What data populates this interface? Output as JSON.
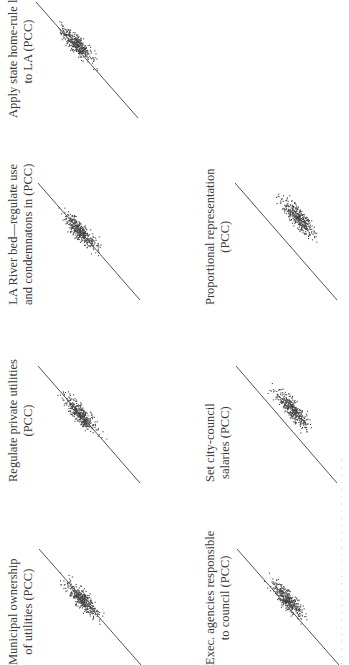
{
  "figure": {
    "orientation": "rotated-90-ccw",
    "caption_visible": "partially clipped at right edge (illegible)"
  },
  "panels": [
    {
      "id": "apply-state-home-rule",
      "label_line1": "Apply state home-rule law",
      "label_line2": "to LA (PCC)"
    },
    {
      "id": "la-river-bed",
      "label_line1": "LA River bed—regulate use",
      "label_line2": "and condemnatons in (PCC)"
    },
    {
      "id": "proportional-representation",
      "label_line1": "Proportional representation",
      "label_line2": "(PCC)"
    },
    {
      "id": "regulate-private-utilities",
      "label_line1": "Regulate private utilities",
      "label_line2": "(PCC)"
    },
    {
      "id": "set-city-council-salaries",
      "label_line1": "Set city-council",
      "label_line2": "salaries (PCC)"
    },
    {
      "id": "municipal-ownership",
      "label_line1": "Municipal ownership",
      "label_line2": "of utilities (PCC)"
    },
    {
      "id": "exec-agencies",
      "label_line1": "Exec. agencies responsible",
      "label_line2": "to council (PCC)"
    }
  ],
  "chart_data": [
    {
      "type": "scatter",
      "title": "Apply state home-rule law to LA (PCC)",
      "reference_line": "y = x (45° diagonal)",
      "points_approx": "~400",
      "relation": "clustered along diagonal, slight spread"
    },
    {
      "type": "scatter",
      "title": "LA River bed—regulate use and condemnatons in (PCC)",
      "reference_line": "y = x (45° diagonal)",
      "points_approx": "~400",
      "relation": "clustered along diagonal"
    },
    {
      "type": "scatter",
      "title": "Proportional representation (PCC)",
      "reference_line": "y = x (45° diagonal)",
      "points_approx": "~400",
      "relation": "cloud shifted off diagonal to one side"
    },
    {
      "type": "scatter",
      "title": "Regulate private utilities (PCC)",
      "reference_line": "y = x (45° diagonal)",
      "points_approx": "~400",
      "relation": "clustered along diagonal"
    },
    {
      "type": "scatter",
      "title": "Set city-council salaries (PCC)",
      "reference_line": "y = x (45° diagonal)",
      "points_approx": "~400",
      "relation": "cloud slightly shifted off diagonal"
    },
    {
      "type": "scatter",
      "title": "Municipal ownership of utilities (PCC)",
      "reference_line": "y = x (45° diagonal)",
      "points_approx": "~400",
      "relation": "clustered along diagonal"
    },
    {
      "type": "scatter",
      "title": "Exec. agencies responsible to council (PCC)",
      "reference_line": "y = x (45° diagonal)",
      "points_approx": "~400",
      "relation": "clustered along diagonal"
    }
  ]
}
